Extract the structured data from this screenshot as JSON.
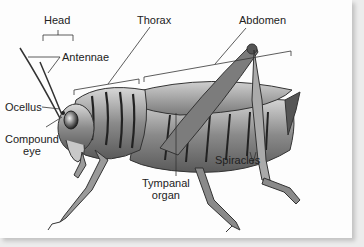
{
  "diagram": {
    "labels": {
      "head": "Head",
      "thorax": "Thorax",
      "abdomen": "Abdomen",
      "antennae": "Antennae",
      "ocellus": "Ocellus",
      "compound_eye_line1": "Compound",
      "compound_eye_line2": "eye",
      "tympanal_line1": "Tympanal",
      "tympanal_line2": "organ",
      "spiracles": "Spiracles"
    },
    "colors": {
      "background": "#fdfdfd",
      "line": "#333333",
      "body_dark": "#3a3a3a",
      "body_light": "#bdbdbd"
    }
  }
}
